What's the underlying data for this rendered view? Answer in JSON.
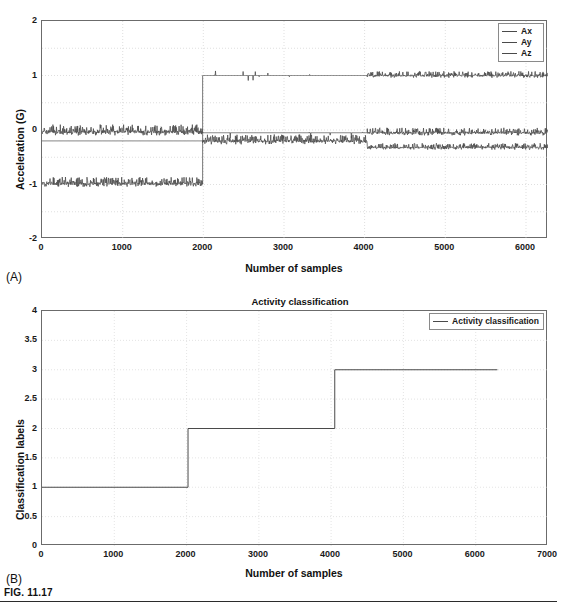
{
  "figure": {
    "caption": "FIG. 11.17",
    "panel_a_letter": "(A)",
    "panel_b_letter": "(B)"
  },
  "panel_a": {
    "xlabel": "Number of samples",
    "ylabel": "Acceleration (G)",
    "title": "",
    "legend": [
      {
        "label": "Ax",
        "color": "#4a4a4a"
      },
      {
        "label": "Ay",
        "color": "#4a4a4a"
      },
      {
        "label": "Az",
        "color": "#4a4a4a"
      }
    ],
    "yticks": [
      "2",
      "1",
      "0",
      "-1",
      "-2"
    ],
    "xticks": [
      "0",
      "1000",
      "2000",
      "3000",
      "4000",
      "5000",
      "6000"
    ]
  },
  "panel_b": {
    "title": "Activity classification",
    "xlabel": "Number of samples",
    "ylabel": "Classification labels",
    "legend": [
      {
        "label": "Activity classification",
        "color": "#4a4a4a"
      }
    ],
    "yticks": [
      "4",
      "3.5",
      "3",
      "2.5",
      "2",
      "1.5",
      "1",
      "0.5",
      "0"
    ],
    "xticks": [
      "0",
      "1000",
      "2000",
      "3000",
      "4000",
      "5000",
      "6000",
      "7000"
    ]
  },
  "chart_data": [
    {
      "type": "line",
      "panel": "A",
      "title": "",
      "xlabel": "Number of samples",
      "ylabel": "Acceleration (G)",
      "xlim": [
        0,
        6300
      ],
      "ylim": [
        -2,
        2
      ],
      "xticks": [
        0,
        1000,
        2000,
        3000,
        4000,
        5000,
        6000
      ],
      "yticks": [
        -2,
        -1,
        0,
        1,
        2
      ],
      "minor_yticks": [
        -1.5,
        -0.5,
        0.5,
        1.5
      ],
      "grid": true,
      "legend_position": "top-right",
      "series": [
        {
          "name": "Ax",
          "color": "#4a4a4a",
          "description": "Noisy band centered near 0 G for samples 0-2000, near-flat slightly below 0 for 2000-4000, noisy band near -0.05 G for 4000-6300",
          "segments": [
            {
              "x_start": 0,
              "x_end": 2000,
              "baseline": -0.03,
              "noise_amplitude": 0.1,
              "dense": true
            },
            {
              "x_start": 2000,
              "x_end": 4050,
              "baseline": -0.05,
              "noise_amplitude": 0.01,
              "dense": false
            },
            {
              "x_start": 4050,
              "x_end": 6300,
              "baseline": -0.05,
              "noise_amplitude": 0.07,
              "dense": true
            }
          ]
        },
        {
          "name": "Ay",
          "color": "#4a4a4a",
          "description": "Flat at -0.2 G for samples 0-2000, noisy band at -0.2 G for 2000-4050, shifts to a noisy band near -0.3 G for 4050-6300",
          "segments": [
            {
              "x_start": 0,
              "x_end": 2000,
              "baseline": -0.2,
              "noise_amplitude": 0.0,
              "dense": false
            },
            {
              "x_start": 2000,
              "x_end": 4050,
              "baseline": -0.2,
              "noise_amplitude": 0.09,
              "dense": true
            },
            {
              "x_start": 4050,
              "x_end": 6300,
              "baseline": -0.32,
              "noise_amplitude": 0.06,
              "dense": true
            }
          ]
        },
        {
          "name": "Az",
          "color": "#4a4a4a",
          "description": "Noisy band at -1 G for samples 0-2000, steps up to a flat +1 G for 2000-4050, noisy band at +1 G for 4050-6300",
          "segments": [
            {
              "x_start": 0,
              "x_end": 2000,
              "baseline": -0.98,
              "noise_amplitude": 0.09,
              "dense": true
            },
            {
              "x_start": 2000,
              "x_end": 4050,
              "baseline": 1.0,
              "noise_amplitude": 0.01,
              "dense": false
            },
            {
              "x_start": 4050,
              "x_end": 6300,
              "baseline": 1.0,
              "noise_amplitude": 0.06,
              "dense": true
            }
          ]
        }
      ]
    },
    {
      "type": "line",
      "panel": "B",
      "title": "Activity classification",
      "xlabel": "Number of samples",
      "ylabel": "Classification labels",
      "xlim": [
        0,
        7000
      ],
      "ylim": [
        0,
        4
      ],
      "xticks": [
        0,
        1000,
        2000,
        3000,
        4000,
        5000,
        6000,
        7000
      ],
      "yticks": [
        0,
        0.5,
        1,
        1.5,
        2,
        2.5,
        3,
        3.5,
        4
      ],
      "grid": true,
      "legend_position": "top-right",
      "series": [
        {
          "name": "Activity classification",
          "color": "#4a4a4a",
          "style": "step",
          "x": [
            0,
            2020,
            2020,
            4050,
            4050,
            6300
          ],
          "y": [
            1,
            1,
            2,
            2,
            3,
            3
          ]
        }
      ]
    }
  ]
}
